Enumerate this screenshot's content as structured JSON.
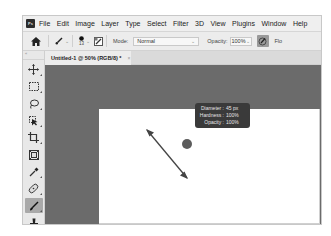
{
  "app": {
    "logo_text": "Ps"
  },
  "menubar": {
    "items": [
      "File",
      "Edit",
      "Image",
      "Layer",
      "Type",
      "Select",
      "Filter",
      "3D",
      "View",
      "Plugins",
      "Window",
      "Help"
    ]
  },
  "options_bar": {
    "brush_size": "13",
    "mode_label": "Mode:",
    "mode_value": "Normal",
    "opacity_label": "Opacity:",
    "opacity_value": "100%",
    "flow_label_partial": "Flo"
  },
  "document_tab": {
    "title": "Untitled-1 @ 50% (RGB/8) *",
    "close": "×"
  },
  "tools_panel": {
    "collapse_label": "«",
    "tools": [
      {
        "name": "move-tool",
        "active": false
      },
      {
        "name": "marquee-tool",
        "active": false
      },
      {
        "name": "lasso-tool",
        "active": false
      },
      {
        "name": "object-selection-tool",
        "active": false
      },
      {
        "name": "crop-tool",
        "active": false
      },
      {
        "name": "frame-tool",
        "active": false
      },
      {
        "name": "eyedropper-tool",
        "active": false
      },
      {
        "name": "healing-brush-tool",
        "active": false
      },
      {
        "name": "brush-tool",
        "active": true
      },
      {
        "name": "clone-stamp-tool",
        "active": false
      }
    ]
  },
  "brush_tooltip": {
    "rows": [
      {
        "key": "Diameter :",
        "value": "45 px"
      },
      {
        "key": "Hardness :",
        "value": "100%"
      },
      {
        "key": "Opacity :",
        "value": "100%"
      }
    ]
  },
  "colors": {
    "pasteboard": "#6b6b6b",
    "canvas": "#ffffff",
    "tooltip_bg": "#3a3a3a",
    "active_tool": "#a9a9a9"
  }
}
